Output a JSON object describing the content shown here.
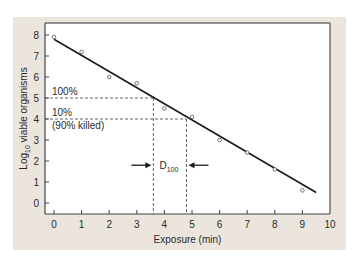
{
  "chart_data": {
    "type": "scatter",
    "title": "",
    "xlabel": "Exposure (min)",
    "ylabel": "Log10 viable organisms",
    "ylabel_main": "Log",
    "ylabel_sub": "10",
    "ylabel_rest": " viable organisms",
    "xlim": [
      0,
      10
    ],
    "ylim": [
      0,
      8
    ],
    "x_ticks": [
      0,
      1,
      2,
      3,
      4,
      5,
      6,
      7,
      8,
      9,
      10
    ],
    "y_ticks": [
      0,
      1,
      2,
      3,
      4,
      5,
      6,
      7,
      8
    ],
    "grid": false,
    "series": [
      {
        "name": "observed",
        "x": [
          0,
          1,
          2,
          3,
          4,
          5,
          6,
          7,
          8,
          9
        ],
        "y": [
          7.9,
          7.2,
          6.0,
          5.7,
          4.5,
          4.1,
          3.0,
          2.4,
          1.6,
          0.6
        ]
      },
      {
        "name": "fit line",
        "x": [
          0,
          9.5
        ],
        "y": [
          7.8,
          0.5
        ]
      }
    ],
    "annotations": {
      "label_100": "100%",
      "label_10": "10%",
      "label_90_killed": "(90% killed)",
      "d_label_main": "D",
      "d_label_sub": "100",
      "ref_y_100": 5,
      "ref_y_10": 4,
      "ref_x_100": 3.6,
      "ref_x_10": 4.8,
      "arrow_y": 1.8
    }
  },
  "colors": {
    "panel": "#ebe5dd",
    "plot_bg": "#ffffff",
    "line": "#1a1a1a",
    "frame": "#6e6e6e",
    "text": "#2a2a2a"
  }
}
